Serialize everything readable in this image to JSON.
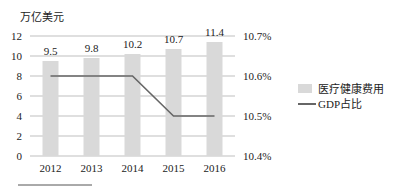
{
  "chart_data": {
    "type": "bar+line",
    "title": "",
    "categories": [
      "2012",
      "2013",
      "2014",
      "2015",
      "2016"
    ],
    "series": [
      {
        "name": "医疗健康费用",
        "type": "bar",
        "axis": "left",
        "values": [
          9.5,
          9.8,
          10.2,
          10.7,
          11.4
        ],
        "color": "#d9d9d9"
      },
      {
        "name": "GDP占比",
        "type": "line",
        "axis": "right",
        "values": [
          10.6,
          10.6,
          10.6,
          10.5,
          10.5
        ],
        "color": "#666666"
      }
    ],
    "left_axis": {
      "label": "万亿美元",
      "ylim": [
        0,
        12
      ],
      "ticks": [
        "0",
        "2",
        "4",
        "6",
        "8",
        "10",
        "12"
      ]
    },
    "right_axis": {
      "label": "",
      "ylim": [
        10.4,
        10.7
      ],
      "ticks": [
        "10.4%",
        "10.5%",
        "10.6%",
        "10.7%"
      ]
    },
    "data_labels": [
      "9.5",
      "9.8",
      "10.2",
      "10.7",
      "11.4"
    ],
    "grid": true,
    "legend": {
      "position": "right",
      "entries": [
        "医疗健康费用",
        "GDP占比"
      ]
    }
  }
}
